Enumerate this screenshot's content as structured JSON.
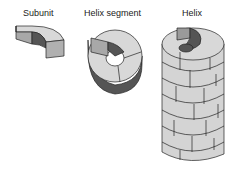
{
  "labels": {
    "subunit": "Subunit",
    "segment": "Helix segment",
    "helix": "Helix"
  },
  "colors": {
    "top": "#d8d8d8",
    "light_side": "#c8c8c8",
    "mid_side": "#9a9a9a",
    "dark_side": "#555555",
    "outline": "#222222"
  }
}
